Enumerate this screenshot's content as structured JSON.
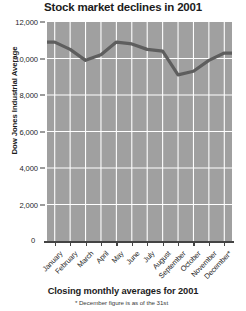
{
  "title": "Stock market declines in 2001",
  "footer": {
    "caption": "Closing monthly averages for 2001",
    "note": "* December figure is as of the 31st"
  },
  "axes": {
    "y_title": "Dow Jones Industrial Average",
    "zero_label": "0"
  },
  "colors": {
    "plot_fill": "#a0a0a0",
    "line": "#5e5e5e",
    "grid": "#ffffff",
    "background": "#ffffff",
    "text": "#1c1c1c"
  },
  "chart_data": {
    "type": "area",
    "title": "Stock market declines in 2001",
    "xlabel": "",
    "ylabel": "Dow Jones Industrial Average",
    "ylim": [
      0,
      12000
    ],
    "ytick_labels": [
      "12,000",
      "10,000",
      "8,000",
      "6,000",
      "4,000",
      "2,000",
      "0"
    ],
    "yticks": [
      12000,
      10000,
      8000,
      6000,
      4000,
      2000,
      0
    ],
    "grid": true,
    "legend": "none",
    "categories": [
      "January",
      "February",
      "March",
      "April",
      "May",
      "June",
      "July",
      "August",
      "September",
      "October",
      "November",
      "December*"
    ],
    "values": [
      10900,
      10500,
      9900,
      10200,
      10900,
      10800,
      10500,
      10400,
      9100,
      9300,
      9900,
      10300
    ],
    "annotations": [
      "* December figure is as of the 31st"
    ]
  }
}
